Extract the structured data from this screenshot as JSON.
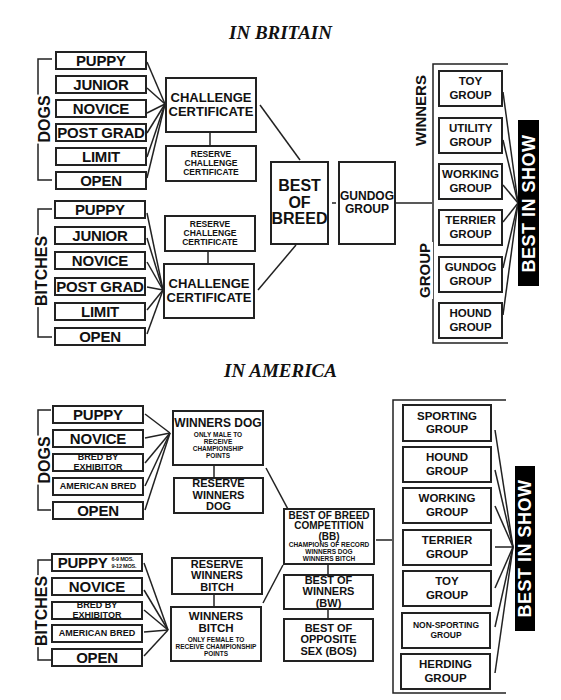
{
  "britain": {
    "title": "IN BRITAIN",
    "dogs_label": "DOGS",
    "bitches_label": "BITCHES",
    "dog_classes": [
      "PUPPY",
      "JUNIOR",
      "NOVICE",
      "POST GRAD",
      "LIMIT",
      "OPEN"
    ],
    "bitch_classes": [
      "PUPPY",
      "JUNIOR",
      "NOVICE",
      "POST GRAD",
      "LIMIT",
      "OPEN"
    ],
    "dog_cc": "CHALLENGE CERTIFICATE",
    "dog_rcc": "RESERVE CHALLENGE CERTIFICATE",
    "bitch_rcc": "RESERVE CHALLENGE CERTIFICATE",
    "bitch_cc": "CHALLENGE CERTIFICATE",
    "best_of_breed": "BEST OF BREED",
    "gundog_group": "GUNDOG GROUP",
    "group_winners_label_top": "WINNERS",
    "group_winners_label_bottom": "GROUP",
    "groups": [
      "TOY GROUP",
      "UTILITY GROUP",
      "WORKING GROUP",
      "TERRIER GROUP",
      "GUNDOG GROUP",
      "HOUND GROUP"
    ],
    "best_in_show": "BEST IN SHOW"
  },
  "america": {
    "title": "IN AMERICA",
    "dogs_label": "DOGS",
    "bitches_label": "BITCHES",
    "dog_classes": [
      "PUPPY",
      "NOVICE",
      "BRED BY EXHIBITOR",
      "AMERICAN BRED",
      "OPEN"
    ],
    "bitch_classes": [
      "PUPPY",
      "NOVICE",
      "BRED BY EXHIBITOR",
      "AMERICAN BRED",
      "OPEN"
    ],
    "puppy_ages": [
      "6-9 MOS.",
      "9-12 MOS."
    ],
    "winners_dog": {
      "title": "WINNERS DOG",
      "note": "ONLY MALE TO RECEIVE CHAMPIONSHIP POINTS"
    },
    "reserve_winners_dog": "RESERVE WINNERS DOG",
    "reserve_winners_bitch": "RESERVE WINNERS BITCH",
    "winners_bitch": {
      "title": "WINNERS BITCH",
      "note": "ONLY FEMALE TO RECEIVE CHAMPIONSHIP POINTS"
    },
    "bob_competition": {
      "title": "BEST OF BREED COMPETITION (BB)",
      "lines": [
        "CHAMPIONS OF RECORD",
        "WINNERS DOG",
        "WINNERS BITCH"
      ]
    },
    "best_of_winners": "BEST OF WINNERS (BW)",
    "best_opposite_sex": "BEST OF OPPOSITE SEX (BOS)",
    "groups": [
      "SPORTING GROUP",
      "HOUND GROUP",
      "WORKING GROUP",
      "TERRIER GROUP",
      "TOY GROUP",
      "NON-SPORTING GROUP",
      "HERDING GROUP"
    ],
    "best_in_show": "BEST IN SHOW"
  }
}
